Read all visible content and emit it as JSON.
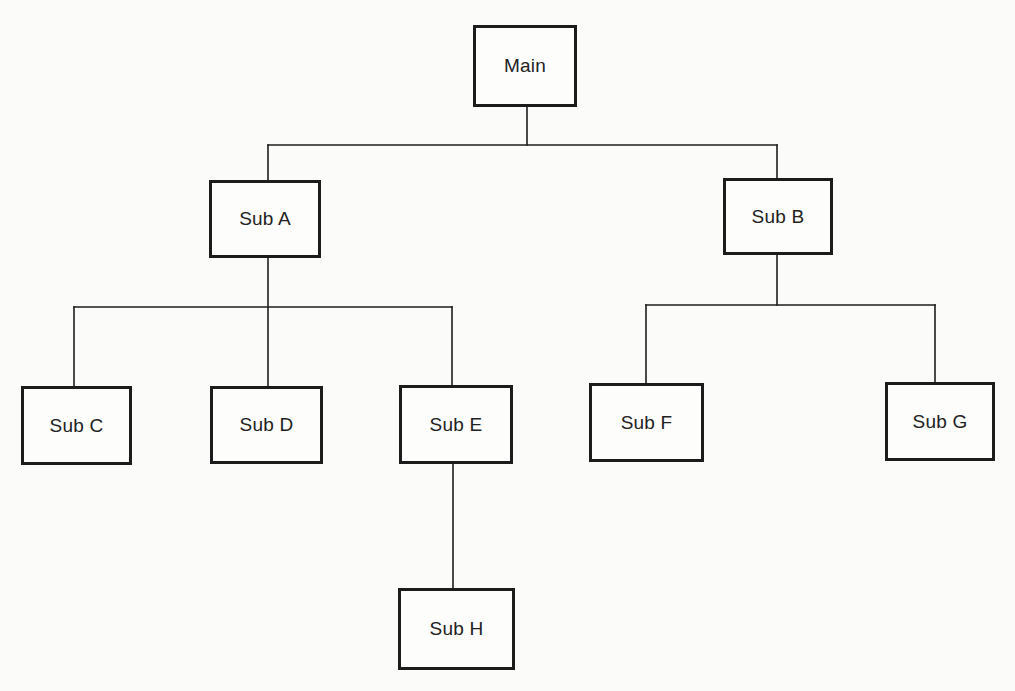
{
  "diagram": {
    "type": "hierarchy-chart",
    "nodes": [
      {
        "id": "main",
        "label": "Main",
        "x": 473,
        "y": 25,
        "w": 104,
        "h": 82
      },
      {
        "id": "sub_a",
        "label": "Sub A",
        "x": 209,
        "y": 180,
        "w": 112,
        "h": 78
      },
      {
        "id": "sub_b",
        "label": "Sub B",
        "x": 723,
        "y": 178,
        "w": 110,
        "h": 77
      },
      {
        "id": "sub_c",
        "label": "Sub C",
        "x": 21,
        "y": 386,
        "w": 111,
        "h": 79
      },
      {
        "id": "sub_d",
        "label": "Sub D",
        "x": 210,
        "y": 386,
        "w": 113,
        "h": 78
      },
      {
        "id": "sub_e",
        "label": "Sub E",
        "x": 399,
        "y": 385,
        "w": 114,
        "h": 79
      },
      {
        "id": "sub_f",
        "label": "Sub F",
        "x": 589,
        "y": 383,
        "w": 115,
        "h": 79
      },
      {
        "id": "sub_g",
        "label": "Sub G",
        "x": 885,
        "y": 382,
        "w": 110,
        "h": 79
      },
      {
        "id": "sub_h",
        "label": "Sub H",
        "x": 398,
        "y": 588,
        "w": 117,
        "h": 82
      }
    ],
    "edges": [
      {
        "from": "main",
        "to": "sub_a"
      },
      {
        "from": "main",
        "to": "sub_b"
      },
      {
        "from": "sub_a",
        "to": "sub_c"
      },
      {
        "from": "sub_a",
        "to": "sub_d"
      },
      {
        "from": "sub_a",
        "to": "sub_e"
      },
      {
        "from": "sub_b",
        "to": "sub_f"
      },
      {
        "from": "sub_b",
        "to": "sub_g"
      },
      {
        "from": "sub_e",
        "to": "sub_h"
      }
    ],
    "connector_lines": [
      {
        "x1": 527,
        "y1": 107,
        "x2": 527,
        "y2": 145
      },
      {
        "x1": 268,
        "y1": 145,
        "x2": 777,
        "y2": 145
      },
      {
        "x1": 268,
        "y1": 145,
        "x2": 268,
        "y2": 180
      },
      {
        "x1": 777,
        "y1": 145,
        "x2": 777,
        "y2": 178
      },
      {
        "x1": 268,
        "y1": 258,
        "x2": 268,
        "y2": 386
      },
      {
        "x1": 74,
        "y1": 307,
        "x2": 452,
        "y2": 307
      },
      {
        "x1": 74,
        "y1": 307,
        "x2": 74,
        "y2": 386
      },
      {
        "x1": 452,
        "y1": 307,
        "x2": 452,
        "y2": 385
      },
      {
        "x1": 777,
        "y1": 255,
        "x2": 777,
        "y2": 305
      },
      {
        "x1": 646,
        "y1": 305,
        "x2": 935,
        "y2": 305
      },
      {
        "x1": 646,
        "y1": 305,
        "x2": 646,
        "y2": 383
      },
      {
        "x1": 935,
        "y1": 305,
        "x2": 935,
        "y2": 382
      },
      {
        "x1": 453,
        "y1": 464,
        "x2": 453,
        "y2": 588
      }
    ]
  }
}
